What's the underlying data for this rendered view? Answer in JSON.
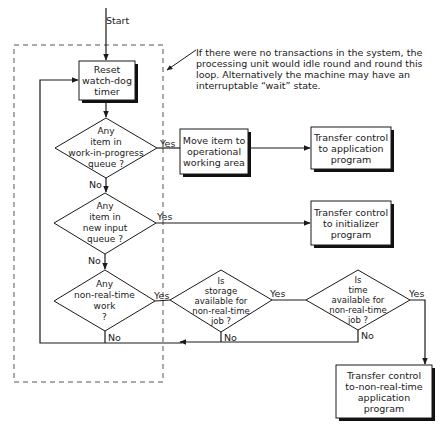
{
  "start_label": "Start",
  "annotation": "If there were no transactions in the system, the processing unit would idle round and round this loop. Alternatively the machine may have an interruptable “wait” state.",
  "nodes": {
    "reset": "Reset\nwatch-dog\ntimer",
    "q_wip": "Any\nitem in\nwork-in-progress\nqueue ?",
    "move_item": "Move item to\noperational\nworking area",
    "transfer_app": "Transfer control\nto application\nprogram",
    "q_input": "Any\nitem in\nnew input\nqueue ?",
    "transfer_init": "Transfer control\nto initializer\nprogram",
    "q_nrt": "Any\nnon-real-time\nwork\n?",
    "q_storage": "Is\nstorage\navailable for\nnon-real-time\njob ?",
    "q_time": "Is\ntime\navailable for\nnon-real-time\njob ?",
    "transfer_nrt": "Transfer control\nto-non-real-time\napplication\nprogram"
  },
  "edge_labels": {
    "yes": "Yes",
    "no": "No"
  },
  "colors": {
    "line": "#1a1a1a",
    "shadow": "#111111",
    "dash": "#555555"
  }
}
